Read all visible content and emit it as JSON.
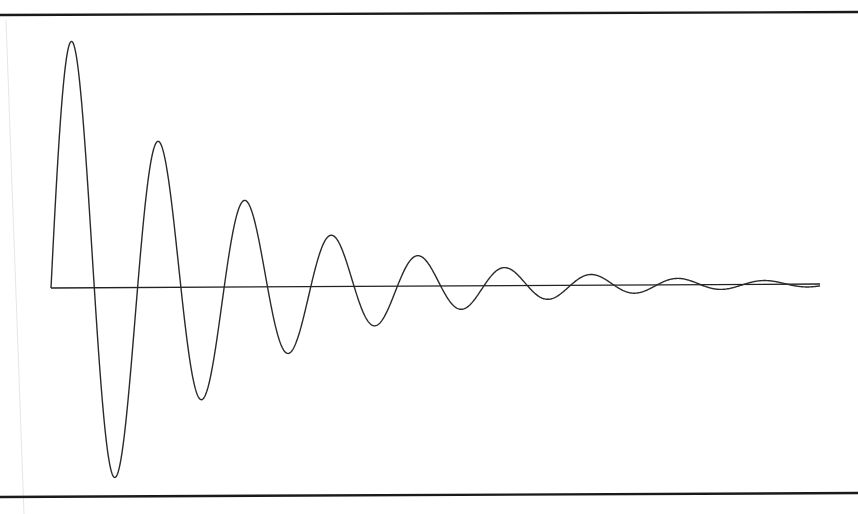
{
  "chart_data": {
    "type": "line",
    "title": "",
    "xlabel": "",
    "ylabel": "",
    "grid": false,
    "legend": null,
    "series": [
      {
        "name": "damped oscillation",
        "model": "y = A * exp(-k * t) * sin(2*pi*t)",
        "amplitude": 1.0,
        "decay_per_period": 0.523,
        "period": 1.0,
        "t_range": [
          0,
          8.88
        ],
        "extrema": [
          {
            "t": 0.22,
            "y": 0.875
          },
          {
            "t": 0.75,
            "y": -0.675
          },
          {
            "t": 1.22,
            "y": 0.529
          },
          {
            "t": 1.74,
            "y": -0.411
          },
          {
            "t": 2.24,
            "y": 0.314
          },
          {
            "t": 2.75,
            "y": -0.243
          },
          {
            "t": 3.24,
            "y": 0.189
          },
          {
            "t": 3.74,
            "y": -0.146
          },
          {
            "t": 4.24,
            "y": 0.118
          },
          {
            "t": 4.73,
            "y": -0.086
          },
          {
            "t": 5.24,
            "y": 0.071
          },
          {
            "t": 5.74,
            "y": -0.054
          },
          {
            "t": 6.23,
            "y": 0.05
          },
          {
            "t": 6.75,
            "y": -0.025
          },
          {
            "t": 7.24,
            "y": 0.036
          },
          {
            "t": 7.73,
            "y": -0.011
          },
          {
            "t": 8.24,
            "y": 0.025
          }
        ]
      }
    ],
    "xlim": [
      0,
      8.88
    ],
    "ylim": [
      -1,
      1
    ]
  },
  "layout": {
    "frame_top": {
      "x1": 0,
      "y1": 15,
      "x2": 858,
      "y2": 12
    },
    "frame_bottom": {
      "x1": 0,
      "y1": 497,
      "x2": 858,
      "y2": 493
    },
    "axis": {
      "x1": 51,
      "y1": 288,
      "x2": 820,
      "y2": 284
    },
    "origin_px": {
      "x": 51,
      "y": 288
    },
    "period_px": 86.6,
    "amplitude_px": 280
  }
}
